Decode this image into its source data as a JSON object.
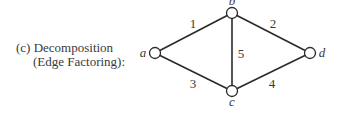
{
  "caption": {
    "line1": "(c) Decomposition",
    "line2": "(Edge Factoring):"
  },
  "graph": {
    "nodes": [
      {
        "id": "a",
        "label": "a",
        "x": 155,
        "y": 53,
        "lx": 143,
        "ly": 57,
        "anchor": "middle"
      },
      {
        "id": "b",
        "label": "b",
        "x": 232,
        "y": 13,
        "lx": 232,
        "ly": 5,
        "anchor": "middle"
      },
      {
        "id": "c",
        "label": "c",
        "x": 232,
        "y": 91,
        "lx": 232,
        "ly": 106,
        "anchor": "middle"
      },
      {
        "id": "d",
        "label": "d",
        "x": 310,
        "y": 53,
        "lx": 322,
        "ly": 57,
        "anchor": "middle"
      }
    ],
    "edges": [
      {
        "id": "1",
        "label": "1",
        "from": "a",
        "to": "b",
        "lx": 193,
        "ly": 28
      },
      {
        "id": "2",
        "label": "2",
        "from": "b",
        "to": "d",
        "lx": 273,
        "ly": 28
      },
      {
        "id": "3",
        "label": "3",
        "from": "a",
        "to": "c",
        "lx": 193,
        "ly": 88
      },
      {
        "id": "4",
        "label": "4",
        "from": "c",
        "to": "d",
        "lx": 272,
        "ly": 88
      },
      {
        "id": "5",
        "label": "5",
        "from": "b",
        "to": "c",
        "lx": 241,
        "ly": 58
      }
    ]
  }
}
